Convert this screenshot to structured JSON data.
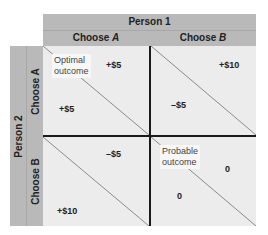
{
  "header": {
    "person1": "Person 1",
    "col_a_prefix": "Choose ",
    "col_a_letter": "A",
    "col_b_prefix": "Choose ",
    "col_b_letter": "B"
  },
  "side": {
    "person2": "Person 2",
    "row_a": "Choose A",
    "row_b": "Choose B"
  },
  "cells": {
    "aa": {
      "note_line1": "Optimal",
      "note_line2": "outcome",
      "p1": "+$5",
      "p2": "+$5"
    },
    "ab": {
      "p1": "+$10",
      "p2": "–$5"
    },
    "ba": {
      "p1": "–$5",
      "p2": "+$10"
    },
    "bb": {
      "note_line1": "Probable",
      "note_line2": "outcome",
      "p1": "0",
      "p2": "0"
    }
  },
  "colors": {
    "header_band": "#b9b9b9",
    "cell_bg": "#ececec",
    "divider": "#1a1a1a",
    "diagonal": "#8a8a8a"
  }
}
